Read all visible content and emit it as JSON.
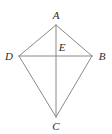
{
  "figure": {
    "kind": "geometry-diagram",
    "shape_name": "kite",
    "canvas": {
      "width": 112,
      "height": 134,
      "background": "#ffffff"
    },
    "style": {
      "stroke_color": "#8a8a8a",
      "stroke_width": 1,
      "label_color": "#2b2b2b",
      "label_font_size": 11,
      "label_style": "italic-serif"
    },
    "points": [
      {
        "id": "A",
        "label": "A",
        "x": 56,
        "y": 25,
        "label_x": 56,
        "label_y": 15,
        "role": "top-vertex"
      },
      {
        "id": "D",
        "label": "D",
        "x": 19,
        "y": 56,
        "label_x": 9,
        "label_y": 56,
        "role": "left-vertex"
      },
      {
        "id": "B",
        "label": "B",
        "x": 92,
        "y": 56,
        "label_x": 102,
        "label_y": 56,
        "role": "right-vertex"
      },
      {
        "id": "C",
        "label": "C",
        "x": 56,
        "y": 117,
        "label_x": 56,
        "label_y": 126,
        "role": "bottom-vertex"
      },
      {
        "id": "E",
        "label": "E",
        "x": 56,
        "y": 56,
        "label_x": 62,
        "label_y": 47,
        "role": "diagonal-intersection"
      }
    ],
    "segments": [
      {
        "id": "AD",
        "from": "A",
        "to": "D",
        "kind": "side"
      },
      {
        "id": "AB",
        "from": "A",
        "to": "B",
        "kind": "side"
      },
      {
        "id": "DC",
        "from": "D",
        "to": "C",
        "kind": "side"
      },
      {
        "id": "BC",
        "from": "B",
        "to": "C",
        "kind": "side"
      },
      {
        "id": "AC",
        "from": "A",
        "to": "C",
        "kind": "diagonal-vertical"
      },
      {
        "id": "DB",
        "from": "D",
        "to": "B",
        "kind": "diagonal-horizontal"
      }
    ]
  }
}
